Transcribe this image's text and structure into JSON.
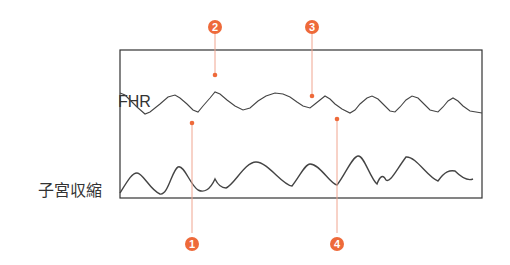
{
  "labels": {
    "fhr": "FHR",
    "uterine_contraction": "子宮収縮"
  },
  "markers": [
    {
      "number": "1"
    },
    {
      "number": "2"
    },
    {
      "number": "3"
    },
    {
      "number": "4"
    }
  ],
  "colors": {
    "accent": "#ee6a3a",
    "line": "#444444",
    "frame": "#333333"
  }
}
